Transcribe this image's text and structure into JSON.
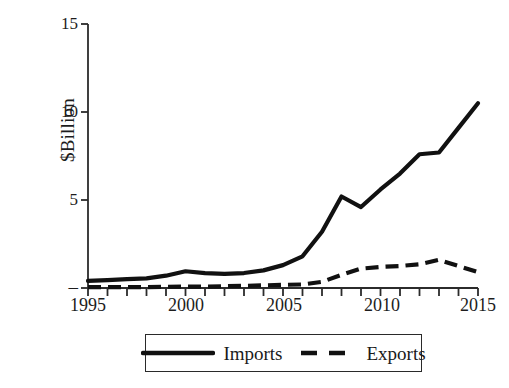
{
  "chart_data": {
    "type": "line",
    "title": "",
    "subtitle": "",
    "xlabel": "",
    "ylabel": "$Billion",
    "xlim": [
      1995,
      2015
    ],
    "ylim": [
      0,
      15
    ],
    "yticks": [
      0,
      5,
      10,
      15
    ],
    "ytick_labels": [
      "–",
      "5",
      "10",
      "15"
    ],
    "xticks": [
      1995,
      1996,
      1997,
      1998,
      1999,
      2000,
      2001,
      2002,
      2003,
      2004,
      2005,
      2006,
      2007,
      2008,
      2009,
      2010,
      2011,
      2012,
      2013,
      2014,
      2015
    ],
    "xtick_labels_shown": [
      "1995",
      "2000",
      "2005",
      "2010",
      "2015"
    ],
    "grid": false,
    "legend_position": "bottom",
    "x": [
      1995,
      1996,
      1997,
      1998,
      1999,
      2000,
      2001,
      2002,
      2003,
      2004,
      2005,
      2006,
      2007,
      2008,
      2009,
      2010,
      2011,
      2012,
      2013,
      2014,
      2015
    ],
    "series": [
      {
        "name": "Imports",
        "style": "solid",
        "color": "#111111",
        "values": [
          0.4,
          0.45,
          0.5,
          0.55,
          0.7,
          0.95,
          0.85,
          0.8,
          0.85,
          1.0,
          1.3,
          1.8,
          3.2,
          5.2,
          4.6,
          5.6,
          6.5,
          7.6,
          7.7,
          9.1,
          10.5
        ]
      },
      {
        "name": "Exports",
        "style": "dashed",
        "color": "#111111",
        "values": [
          0.05,
          0.05,
          0.05,
          0.05,
          0.07,
          0.08,
          0.08,
          0.1,
          0.12,
          0.15,
          0.18,
          0.2,
          0.35,
          0.75,
          1.1,
          1.2,
          1.25,
          1.35,
          1.6,
          1.25,
          0.9
        ]
      }
    ]
  },
  "axes": {
    "y_label": "$Billion",
    "y_tick_labels": [
      {
        "value": 15,
        "text": "15"
      },
      {
        "value": 10,
        "text": "10"
      },
      {
        "value": 5,
        "text": "5"
      },
      {
        "value": 0,
        "text": "–"
      }
    ],
    "x_tick_labels": [
      {
        "value": 1995,
        "text": "1995"
      },
      {
        "value": 2000,
        "text": "2000"
      },
      {
        "value": 2005,
        "text": "2005"
      },
      {
        "value": 2010,
        "text": "2010"
      },
      {
        "value": 2015,
        "text": "2015"
      }
    ]
  },
  "legend": {
    "entries": [
      {
        "label": "Imports",
        "style": "solid"
      },
      {
        "label": "Exports",
        "style": "dashed"
      }
    ]
  }
}
